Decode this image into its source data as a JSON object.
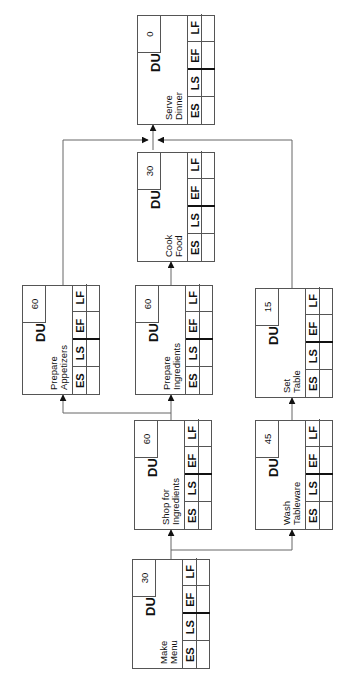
{
  "diagram": {
    "type": "activity-on-node network (rotated 90°)",
    "field_labels": {
      "duration": "DU",
      "es": "ES",
      "ls": "LS",
      "ef": "EF",
      "lf": "LF"
    },
    "nodes": [
      {
        "id": "make-menu",
        "name": "Make\nMenu",
        "du": "30"
      },
      {
        "id": "shop-for-ingredients",
        "name": "Shop for\nIngredients",
        "du": "60"
      },
      {
        "id": "wash-tableware",
        "name": "Wash\nTableware",
        "du": "45"
      },
      {
        "id": "prepare-appetizers",
        "name": "Prepare\nAppetizers",
        "du": "60"
      },
      {
        "id": "prepare-ingredients",
        "name": "Prepare\nIngredients",
        "du": "60"
      },
      {
        "id": "set-table",
        "name": "Set\nTable",
        "du": "15"
      },
      {
        "id": "cook-food",
        "name": "Cook\nFood",
        "du": "30"
      },
      {
        "id": "serve-dinner",
        "name": "Serve\nDinner",
        "du": "0"
      }
    ],
    "edges": [
      {
        "from": "make-menu",
        "to": "shop-for-ingredients"
      },
      {
        "from": "make-menu",
        "to": "wash-tableware"
      },
      {
        "from": "shop-for-ingredients",
        "to": "prepare-appetizers"
      },
      {
        "from": "shop-for-ingredients",
        "to": "prepare-ingredients"
      },
      {
        "from": "wash-tableware",
        "to": "set-table"
      },
      {
        "from": "prepare-ingredients",
        "to": "cook-food"
      },
      {
        "from": "prepare-appetizers",
        "to": "serve-dinner"
      },
      {
        "from": "cook-food",
        "to": "serve-dinner"
      },
      {
        "from": "set-table",
        "to": "serve-dinner"
      }
    ],
    "colors": {
      "line": "#555555",
      "text": "#111111",
      "background": "#ffffff"
    }
  }
}
